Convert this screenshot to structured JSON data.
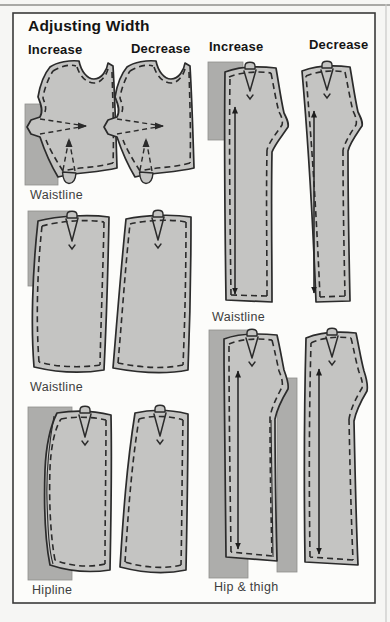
{
  "title": "Adjusting Width",
  "columns": {
    "left_increase": "Increase",
    "left_decrease": "Decrease",
    "right_increase": "Increase",
    "right_decrease": "Decrease"
  },
  "labels": {
    "bodice_row": "Waistline",
    "skirt_waist_row": "Waistline",
    "skirt_hip_row": "Hipline",
    "pants_waist_row": "Waistline",
    "pants_hip_thigh_row": "Hip & thigh"
  },
  "colors": {
    "pattern": "#c4c4c2",
    "backing": "#adadab",
    "outline": "#2b2b2b",
    "frame": "#3a3a3a",
    "paper": "#fcfcfa",
    "pagebg": "#f6f6f4",
    "labelink": "#3e3e3e",
    "headink": "#141414"
  }
}
